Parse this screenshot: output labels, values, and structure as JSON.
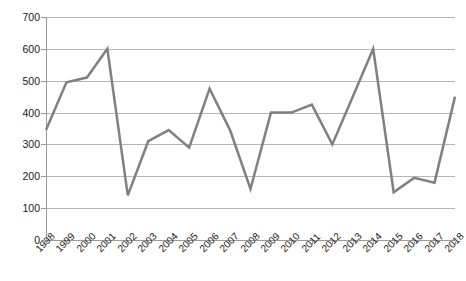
{
  "chart_data": {
    "type": "line",
    "title": "",
    "subtitle": "",
    "xlabel": "",
    "ylabel": "",
    "grid": true,
    "legend": false,
    "legend_position": "none",
    "line_color": "#808080",
    "line_width": 2.5,
    "markers": false,
    "xlim": [
      1998,
      2018
    ],
    "ylim": [
      0,
      700
    ],
    "y_ticks": [
      0,
      100,
      200,
      300,
      400,
      500,
      600,
      700
    ],
    "y_tick_labels": [
      "0",
      "100",
      "200",
      "300",
      "400",
      "500",
      "600",
      "700"
    ],
    "categories": [
      "1998",
      "1999",
      "2000",
      "2001",
      "2002",
      "2003",
      "2004",
      "2005",
      "2006",
      "2007",
      "2008",
      "2009",
      "2010",
      "2011",
      "2012",
      "2013",
      "2014",
      "2015",
      "2016",
      "2017",
      "2018"
    ],
    "x_tick_labels": [
      "1998",
      "1999",
      "2000",
      "2001",
      "2002",
      "2003",
      "2004",
      "2005",
      "2006",
      "2007",
      "2008",
      "2009",
      "2010",
      "2011",
      "2012",
      "2013",
      "2014",
      "2015",
      "2016",
      "2017",
      "2018"
    ],
    "x_tick_rotation": -45,
    "values": [
      345,
      495,
      510,
      600,
      140,
      310,
      345,
      290,
      475,
      345,
      160,
      400,
      400,
      425,
      300,
      450,
      600,
      150,
      195,
      180,
      450
    ],
    "series": [
      {
        "name": "",
        "color": "#808080",
        "values": [
          345,
          495,
          510,
          600,
          140,
          310,
          345,
          290,
          475,
          345,
          160,
          400,
          400,
          425,
          300,
          450,
          600,
          150,
          195,
          180,
          450
        ]
      }
    ],
    "annotations": []
  },
  "colors": {
    "line": "#808080",
    "gridline": "#b6b6b6",
    "axis": "#9a9a9a",
    "text": "#1a1a1a",
    "background": "#ffffff"
  }
}
